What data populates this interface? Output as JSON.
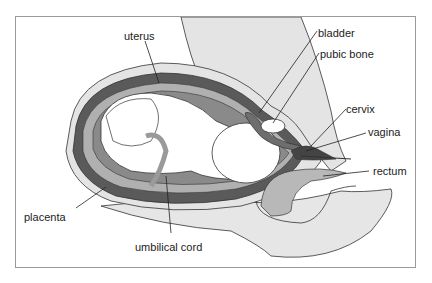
{
  "diagram": {
    "type": "anatomical cross-section",
    "colors": {
      "background": "#ffffff",
      "frame_border": "#9a9a9a",
      "tissue_light": "#e4e4e4",
      "tissue_mid": "#b8b8b8",
      "tissue_dark": "#6e6e6e",
      "uterus_wall": "#555555",
      "outline": "#333333"
    },
    "labels": {
      "uterus": "uterus",
      "bladder": "bladder",
      "pubic_bone": "pubic bone",
      "cervix": "cervix",
      "vagina": "vagina",
      "rectum": "rectum",
      "placenta": "placenta",
      "umbilical_cord": "umbilical cord"
    }
  }
}
